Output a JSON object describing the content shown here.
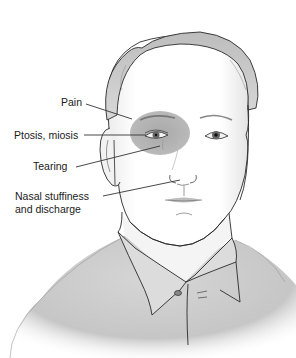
{
  "figure": {
    "shaded_region": "Periorbital area around the right eye (viewer's left)",
    "colors": {
      "background": "#ffffff",
      "shading": "#b9b9b9",
      "outline": "#2a2a2a",
      "shirt": "#c8c8c8",
      "leader_line": "#333333"
    }
  },
  "labels": [
    {
      "id": "pain",
      "text": "Pain"
    },
    {
      "id": "ptosis",
      "text": "Ptosis, miosis"
    },
    {
      "id": "tearing",
      "text": "Tearing"
    },
    {
      "id": "nasal_1",
      "text": "Nasal stuffiness"
    },
    {
      "id": "nasal_2",
      "text": "and discharge"
    }
  ]
}
